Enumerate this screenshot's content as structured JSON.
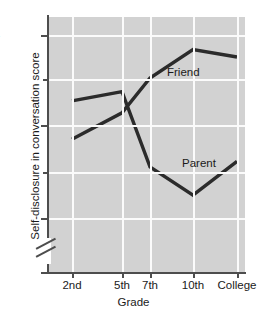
{
  "chart_data": {
    "type": "line",
    "title": "",
    "xlabel": "Grade",
    "ylabel": "Self-disclosure in conversation score",
    "categories": [
      "2nd",
      "5th",
      "7th",
      "10th",
      "College"
    ],
    "ylim": [
      1,
      4.2
    ],
    "yticks": [
      1,
      2,
      3,
      4
    ],
    "ytick_labels": [
      "1",
      "2",
      "3",
      "4"
    ],
    "y_minor_ticks": [
      2.5,
      3.5
    ],
    "y_axis_break": true,
    "y_axis_break_between": [
      1,
      2
    ],
    "grid": true,
    "grid_color": "#fbfbfb",
    "plot_background": "#d2d2d2",
    "line_color": "#2b2b2b",
    "legend_position": "inline-labels",
    "series": [
      {
        "name": "Friend",
        "label": "Friend",
        "values": [
          2.86,
          3.15,
          3.53,
          3.84,
          3.76
        ]
      },
      {
        "name": "Parent",
        "label": "Parent",
        "values": [
          3.28,
          3.38,
          2.56,
          2.25,
          2.62
        ]
      }
    ]
  },
  "axes": {
    "y_title": "Self-disclosure in conversation score",
    "x_title": "Grade",
    "y_labels": {
      "t4": "4",
      "t3": "3",
      "t2": "2",
      "t1": "1"
    },
    "x_labels": {
      "c0": "2nd",
      "c1": "5th",
      "c2": "7th",
      "c3": "10th",
      "c4": "College"
    }
  },
  "series_labels": {
    "friend": "Friend",
    "parent": "Parent"
  }
}
